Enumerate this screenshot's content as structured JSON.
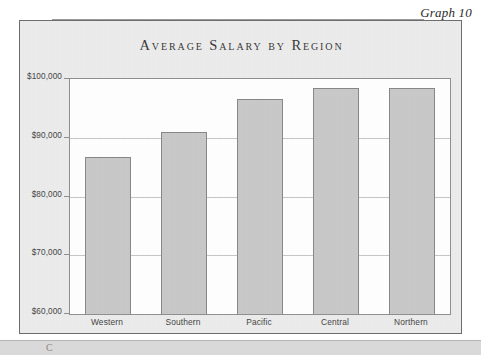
{
  "page": {
    "caption_label": "Graph 10",
    "bottom_strip_glyph": "C"
  },
  "chart": {
    "title": "Average Salary by Region"
  },
  "chart_data": {
    "type": "bar",
    "title": "Average Salary by Region",
    "xlabel": "",
    "ylabel": "",
    "categories": [
      "Western",
      "Southern",
      "Pacific",
      "Central",
      "Northern"
    ],
    "values": [
      86700,
      91000,
      96600,
      98500,
      98500
    ],
    "ylim": [
      60000,
      100000
    ],
    "ytick_values": [
      60000,
      70000,
      80000,
      90000,
      100000
    ],
    "ytick_labels": [
      "$60,000",
      "$70,000",
      "$80,000",
      "$90,000",
      "$100,000"
    ],
    "grid": true,
    "legend": false,
    "bar_color": "#c9c9c9",
    "bar_border_color": "#888888",
    "plot_background": "#ffffff",
    "panel_background": "#ececec"
  }
}
